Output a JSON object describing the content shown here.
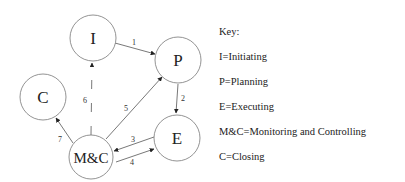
{
  "diagram": {
    "nodes": [
      {
        "id": "I",
        "label": "I"
      },
      {
        "id": "P",
        "label": "P"
      },
      {
        "id": "C",
        "label": "C"
      },
      {
        "id": "E",
        "label": "E"
      },
      {
        "id": "MC",
        "label": "M&C"
      }
    ],
    "edges": [
      {
        "from": "I",
        "to": "P",
        "label": "1",
        "style": "solid"
      },
      {
        "from": "P",
        "to": "E",
        "label": "2",
        "style": "solid"
      },
      {
        "from": "E",
        "to": "M&C",
        "label": "3",
        "style": "solid"
      },
      {
        "from": "M&C",
        "to": "E",
        "label": "4",
        "style": "solid"
      },
      {
        "from": "M&C",
        "to": "P",
        "label": "5",
        "style": "solid"
      },
      {
        "from": "M&C",
        "to": "I",
        "label": "6",
        "style": "dashed"
      },
      {
        "from": "M&C",
        "to": "C",
        "label": "7",
        "style": "solid"
      }
    ]
  },
  "key": {
    "title": "Key:",
    "items": [
      "I=Initiating",
      "P=Planning",
      "E=Executing",
      "M&C=Monitoring and Controlling",
      "C=Closing"
    ]
  }
}
